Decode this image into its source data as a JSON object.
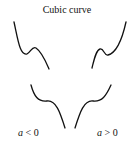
{
  "title": "Cubic curve",
  "labels": {
    "left": {
      "var": "a",
      "rel": " < 0"
    },
    "right": {
      "var": "a",
      "rel": " > 0"
    }
  },
  "curves": {
    "upper_left": "M14,22 C18,40 20,56 27,54 C31,52 32,46 36,48 C42,52 46,62 49,69",
    "upper_right": "M92,68 C94,60 96,50 100,49 C104,48 104,56 108,55 C116,53 122,40 126,22",
    "lower_left": "M31,85 C34,96 38,102 47,101 C56,100 60,112 65,128",
    "lower_right": "M75,128 C80,112 84,100 93,101 C102,102 106,96 111,85"
  },
  "stroke_color": "#111111"
}
